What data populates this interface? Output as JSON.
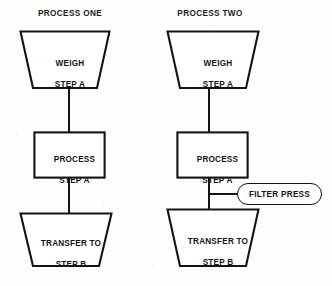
{
  "diagram": {
    "title_visible": false,
    "background_color": "#fdfdfc",
    "line_color": "#141414",
    "columns": [
      {
        "id": "process-one",
        "heading": "PROCESS ONE",
        "nodes": [
          {
            "id": "weigh-step-a",
            "shape": "trapezoid",
            "line1": "WEIGH",
            "line2": "STEP A"
          },
          {
            "id": "process-step-a",
            "shape": "rectangle",
            "line1": "PROCESS",
            "line2": "STEP A"
          },
          {
            "id": "transfer-to-step-b",
            "shape": "trapezoid",
            "line1": "TRANSFER TO",
            "line2": "STEP B"
          }
        ],
        "connectors": [
          "weigh-step-a -> process-step-a",
          "process-step-a -> transfer-to-step-b"
        ]
      },
      {
        "id": "process-two",
        "heading": "PROCESS TWO",
        "nodes": [
          {
            "id": "weigh-step-a",
            "shape": "trapezoid",
            "line1": "WEIGH",
            "line2": "STEP A"
          },
          {
            "id": "process-step-a",
            "shape": "rectangle",
            "line1": "PROCESS",
            "line2": "STEP A"
          },
          {
            "id": "filter-press",
            "shape": "stadium",
            "line1": "FILTER PRESS",
            "line2": ""
          },
          {
            "id": "transfer-to-step-b",
            "shape": "trapezoid",
            "line1": "TRANSFER TO",
            "line2": "STEP B"
          }
        ],
        "connectors": [
          "weigh-step-a -> process-step-a",
          "process-step-a -> transfer-to-step-b",
          "trunk -> filter-press"
        ]
      }
    ]
  }
}
